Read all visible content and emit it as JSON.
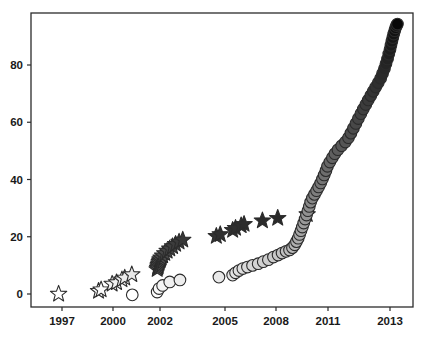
{
  "chart_data": {
    "type": "scatter",
    "title": "",
    "subtitle": "",
    "xlabel": "",
    "ylabel": "",
    "xlim": [
      1996.2,
      2013.8
    ],
    "ylim": [
      -3,
      97
    ],
    "grid": false,
    "legend": null,
    "background_color": "#ffffff",
    "frame_color": "#2b2b2b",
    "xticks": [
      1997,
      2000,
      2002,
      2005,
      2008,
      2011,
      2013
    ],
    "xtick_labels": [
      "1997",
      "2000",
      "2002",
      "2005",
      "2008",
      "2011",
      "2013"
    ],
    "yticks": [
      0,
      20,
      40,
      60,
      80
    ],
    "ytick_labels": [
      "0",
      "20",
      "40",
      "60",
      "80"
    ],
    "series": [
      {
        "name": "stars",
        "marker": "star",
        "marker_size": 11,
        "edge_color": "#2b2b2b",
        "fill_mode": "value-shaded-gray",
        "points": [
          {
            "x": 1996.8,
            "y": 0,
            "fill": "#ffffff"
          },
          {
            "x": 1999.15,
            "y": 1,
            "fill": "#fbfbfb"
          },
          {
            "x": 1999.3,
            "y": 1.5,
            "fill": "#fafafa"
          },
          {
            "x": 1999.95,
            "y": 3.5,
            "fill": "#f2f2f2"
          },
          {
            "x": 2000.15,
            "y": 4.0,
            "fill": "#f0f0f0"
          },
          {
            "x": 2000.38,
            "y": 5.0,
            "fill": "#ededed"
          },
          {
            "x": 2000.5,
            "y": 5.6,
            "fill": "#ebebeb"
          },
          {
            "x": 2000.8,
            "y": 6.8,
            "fill": "#e8e8e8"
          },
          {
            "x": 2001.88,
            "y": 8.6,
            "fill": "#666666"
          },
          {
            "x": 2001.9,
            "y": 9.1,
            "fill": "#626262"
          },
          {
            "x": 2001.92,
            "y": 9.6,
            "fill": "#5f5f5f"
          },
          {
            "x": 2001.93,
            "y": 10.1,
            "fill": "#5c5c5c"
          },
          {
            "x": 2001.95,
            "y": 10.6,
            "fill": "#595959"
          },
          {
            "x": 2001.97,
            "y": 11.1,
            "fill": "#565656"
          },
          {
            "x": 2001.99,
            "y": 11.6,
            "fill": "#545454"
          },
          {
            "x": 2002.01,
            "y": 12.1,
            "fill": "#515151"
          },
          {
            "x": 2002.05,
            "y": 12.7,
            "fill": "#4e4e4e"
          },
          {
            "x": 2002.12,
            "y": 13.4,
            "fill": "#4b4b4b"
          },
          {
            "x": 2002.22,
            "y": 14.2,
            "fill": "#484848"
          },
          {
            "x": 2002.33,
            "y": 15.0,
            "fill": "#454545"
          },
          {
            "x": 2002.45,
            "y": 15.8,
            "fill": "#424242"
          },
          {
            "x": 2002.58,
            "y": 16.6,
            "fill": "#3f3f3f"
          },
          {
            "x": 2002.72,
            "y": 17.4,
            "fill": "#3c3c3c"
          },
          {
            "x": 2002.88,
            "y": 18.2,
            "fill": "#3a3a3a"
          },
          {
            "x": 2003.05,
            "y": 18.9,
            "fill": "#383838"
          },
          {
            "x": 2004.6,
            "y": 20.2,
            "fill": "#333333"
          },
          {
            "x": 2004.78,
            "y": 20.8,
            "fill": "#313131"
          },
          {
            "x": 2005.45,
            "y": 22.3,
            "fill": "#2f2f2f"
          },
          {
            "x": 2005.62,
            "y": 23.0,
            "fill": "#2e2e2e"
          },
          {
            "x": 2005.95,
            "y": 23.9,
            "fill": "#2d2d2d"
          },
          {
            "x": 2006.12,
            "y": 24.4,
            "fill": "#2c2c2c"
          },
          {
            "x": 2007.2,
            "y": 25.6,
            "fill": "#2b2b2b"
          },
          {
            "x": 2008.1,
            "y": 26.5,
            "fill": "#2a2a2a"
          },
          {
            "x": 2009.8,
            "y": 27.8,
            "fill": "#292929"
          }
        ]
      },
      {
        "name": "circles",
        "marker": "circle",
        "marker_size": 11,
        "edge_color": "#2b2b2b",
        "fill_mode": "value-shaded-gray",
        "points": [
          {
            "x": 2000.82,
            "y": -0.3,
            "fill": "#ffffff"
          },
          {
            "x": 2001.88,
            "y": 0.7,
            "fill": "#fcfcfc"
          },
          {
            "x": 2001.96,
            "y": 1.9,
            "fill": "#f8f8f8"
          },
          {
            "x": 2002.12,
            "y": 3.0,
            "fill": "#f4f4f4"
          },
          {
            "x": 2002.45,
            "y": 4.2,
            "fill": "#f0f0f0"
          },
          {
            "x": 2002.92,
            "y": 4.9,
            "fill": "#ededed"
          },
          {
            "x": 2004.72,
            "y": 5.9,
            "fill": "#e9e9e9"
          },
          {
            "x": 2005.45,
            "y": 6.6,
            "fill": "#e6e6e6"
          },
          {
            "x": 2005.62,
            "y": 7.4,
            "fill": "#e3e3e3"
          },
          {
            "x": 2005.82,
            "y": 8.2,
            "fill": "#e0e0e0"
          },
          {
            "x": 2006.05,
            "y": 8.9,
            "fill": "#dddddd"
          },
          {
            "x": 2006.32,
            "y": 9.4,
            "fill": "#dadada"
          },
          {
            "x": 2006.62,
            "y": 10.0,
            "fill": "#d7d7d7"
          },
          {
            "x": 2006.95,
            "y": 10.6,
            "fill": "#d4d4d4"
          },
          {
            "x": 2007.25,
            "y": 11.3,
            "fill": "#d1d1d1"
          },
          {
            "x": 2007.55,
            "y": 12.0,
            "fill": "#cecece"
          },
          {
            "x": 2007.85,
            "y": 12.9,
            "fill": "#cacaca"
          },
          {
            "x": 2008.12,
            "y": 13.6,
            "fill": "#c7c7c7"
          },
          {
            "x": 2008.35,
            "y": 14.3,
            "fill": "#c3c3c3"
          },
          {
            "x": 2008.58,
            "y": 14.9,
            "fill": "#c0c0c0"
          },
          {
            "x": 2008.78,
            "y": 15.4,
            "fill": "#bcbcbc"
          },
          {
            "x": 2008.95,
            "y": 16.2,
            "fill": "#b9b9b9"
          },
          {
            "x": 2009.08,
            "y": 17.2,
            "fill": "#b5b5b5"
          },
          {
            "x": 2009.18,
            "y": 18.3,
            "fill": "#b1b1b1"
          },
          {
            "x": 2009.28,
            "y": 19.5,
            "fill": "#adadad"
          },
          {
            "x": 2009.36,
            "y": 20.8,
            "fill": "#a9a9a9"
          },
          {
            "x": 2009.44,
            "y": 22.1,
            "fill": "#a5a5a5"
          },
          {
            "x": 2009.52,
            "y": 23.4,
            "fill": "#a1a1a1"
          },
          {
            "x": 2009.6,
            "y": 24.8,
            "fill": "#9d9d9d"
          },
          {
            "x": 2009.68,
            "y": 26.2,
            "fill": "#999999"
          },
          {
            "x": 2009.76,
            "y": 27.6,
            "fill": "#959595"
          },
          {
            "x": 2009.84,
            "y": 29.1,
            "fill": "#919191"
          },
          {
            "x": 2009.92,
            "y": 30.6,
            "fill": "#8d8d8d"
          },
          {
            "x": 2010.0,
            "y": 32.1,
            "fill": "#8a8a8a"
          },
          {
            "x": 2010.1,
            "y": 33.5,
            "fill": "#868686"
          },
          {
            "x": 2010.22,
            "y": 34.8,
            "fill": "#828282"
          },
          {
            "x": 2010.34,
            "y": 36.1,
            "fill": "#7e7e7e"
          },
          {
            "x": 2010.46,
            "y": 37.4,
            "fill": "#7b7b7b"
          },
          {
            "x": 2010.58,
            "y": 38.8,
            "fill": "#777777"
          },
          {
            "x": 2010.68,
            "y": 40.2,
            "fill": "#747474"
          },
          {
            "x": 2010.78,
            "y": 41.6,
            "fill": "#707070"
          },
          {
            "x": 2010.88,
            "y": 43.1,
            "fill": "#6d6d6d"
          },
          {
            "x": 2010.97,
            "y": 44.6,
            "fill": "#696969"
          },
          {
            "x": 2011.06,
            "y": 46.1,
            "fill": "#666666"
          },
          {
            "x": 2011.14,
            "y": 47.6,
            "fill": "#626262"
          },
          {
            "x": 2011.22,
            "y": 49.0,
            "fill": "#5f5f5f"
          },
          {
            "x": 2011.32,
            "y": 50.4,
            "fill": "#5c5c5c"
          },
          {
            "x": 2011.44,
            "y": 51.8,
            "fill": "#585858"
          },
          {
            "x": 2011.56,
            "y": 53.1,
            "fill": "#555555"
          },
          {
            "x": 2011.66,
            "y": 54.6,
            "fill": "#525252"
          },
          {
            "x": 2011.74,
            "y": 56.2,
            "fill": "#4e4e4e"
          },
          {
            "x": 2011.82,
            "y": 57.9,
            "fill": "#4b4b4b"
          },
          {
            "x": 2011.9,
            "y": 59.6,
            "fill": "#484848"
          },
          {
            "x": 2011.98,
            "y": 61.3,
            "fill": "#454545"
          },
          {
            "x": 2012.06,
            "y": 63.0,
            "fill": "#424242"
          },
          {
            "x": 2012.14,
            "y": 64.6,
            "fill": "#3f3f3f"
          },
          {
            "x": 2012.22,
            "y": 66.2,
            "fill": "#3c3c3c"
          },
          {
            "x": 2012.3,
            "y": 67.8,
            "fill": "#3a3a3a"
          },
          {
            "x": 2012.38,
            "y": 69.3,
            "fill": "#373737"
          },
          {
            "x": 2012.46,
            "y": 70.8,
            "fill": "#343434"
          },
          {
            "x": 2012.54,
            "y": 72.3,
            "fill": "#323232"
          },
          {
            "x": 2012.62,
            "y": 73.8,
            "fill": "#2f2f2f"
          },
          {
            "x": 2012.7,
            "y": 75.4,
            "fill": "#2d2d2d"
          },
          {
            "x": 2012.76,
            "y": 77.0,
            "fill": "#2a2a2a"
          },
          {
            "x": 2012.82,
            "y": 78.7,
            "fill": "#282828"
          },
          {
            "x": 2012.87,
            "y": 80.4,
            "fill": "#252525"
          },
          {
            "x": 2012.92,
            "y": 82.1,
            "fill": "#232323"
          },
          {
            "x": 2012.96,
            "y": 83.8,
            "fill": "#202020"
          },
          {
            "x": 2013.0,
            "y": 85.4,
            "fill": "#1e1e1e"
          },
          {
            "x": 2013.03,
            "y": 86.9,
            "fill": "#1b1b1b"
          },
          {
            "x": 2013.06,
            "y": 88.3,
            "fill": "#191919"
          },
          {
            "x": 2013.09,
            "y": 89.6,
            "fill": "#161616"
          },
          {
            "x": 2013.12,
            "y": 90.8,
            "fill": "#141414"
          },
          {
            "x": 2013.15,
            "y": 92.0,
            "fill": "#111111"
          },
          {
            "x": 2013.18,
            "y": 93.0,
            "fill": "#0e0e0e"
          },
          {
            "x": 2013.21,
            "y": 93.8,
            "fill": "#0b0b0b"
          },
          {
            "x": 2013.24,
            "y": 94.3,
            "fill": "#080808"
          }
        ]
      }
    ]
  }
}
